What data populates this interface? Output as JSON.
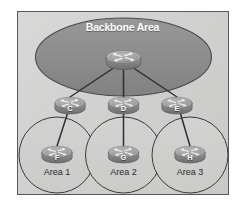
{
  "diagram": {
    "title": "Backbone Area",
    "type": "network-topology",
    "colors": {
      "panel_background": "#d3d3d2",
      "panel_border": "#585858",
      "backbone_ellipse": "#8c8c8c",
      "ellipse_border": "#4a4a4a",
      "router_body": "#8a8a8a",
      "router_top": "#b5b5b5",
      "link_line": "#2f2f2f",
      "area_circle_border": "#3a3a3a",
      "title_text": "#ffffff",
      "label_text": "#2b2b2b"
    },
    "backbone": {
      "label": "Backbone Area",
      "core_router": {
        "name": "core-router",
        "tag": ""
      }
    },
    "border_routers": [
      {
        "tag": "C",
        "name": "router-c"
      },
      {
        "tag": "D",
        "name": "router-d"
      },
      {
        "tag": "E",
        "name": "router-e"
      }
    ],
    "areas": [
      {
        "label": "Area 1",
        "router_tag": "F",
        "name": "area-1"
      },
      {
        "label": "Area 2",
        "router_tag": "G",
        "name": "area-2"
      },
      {
        "label": "Area 3",
        "router_tag": "H",
        "name": "area-3"
      }
    ],
    "links": [
      {
        "from": "core-router",
        "to": "router-c"
      },
      {
        "from": "core-router",
        "to": "router-d"
      },
      {
        "from": "core-router",
        "to": "router-e"
      },
      {
        "from": "router-c",
        "to": "router-f"
      },
      {
        "from": "router-d",
        "to": "router-g"
      },
      {
        "from": "router-e",
        "to": "router-h"
      }
    ]
  }
}
